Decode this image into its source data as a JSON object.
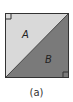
{
  "diagram": {
    "regions": [
      {
        "name": "A",
        "label": "A",
        "color": "#d9d9d9"
      },
      {
        "name": "B",
        "label": "B",
        "color": "#7a7a7a"
      }
    ],
    "border_color": "#333333",
    "caption": "(a)"
  }
}
